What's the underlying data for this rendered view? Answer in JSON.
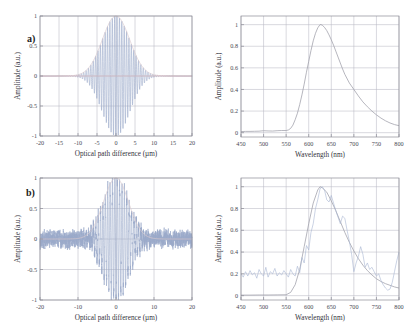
{
  "figure": {
    "background": "#ffffff",
    "width": 410,
    "height": 333
  },
  "panels": [
    {
      "id": "panel-a-interferogram",
      "label": "a)",
      "position": "top-left"
    },
    {
      "id": "panel-a-spectrum",
      "label": "",
      "position": "top-right"
    },
    {
      "id": "panel-b-interferogram",
      "label": "b)",
      "position": "bottom-left"
    },
    {
      "id": "panel-b-spectrum",
      "label": "",
      "position": "bottom-right"
    }
  ],
  "colors": {
    "signal": "#9aa9c9",
    "envelope": "#d9c9cd",
    "zero_line": "#e0b9bd",
    "spectrum_reference": "#9e9ea8",
    "spectrum_measured": "#a8b6d2",
    "grid": "#b9b9c4",
    "frame": "#8c8c96",
    "text": "#33333c"
  },
  "chart_data": [
    {
      "id": "panel-a-interferogram",
      "type": "line",
      "panel_label": "a)",
      "title": "",
      "xlabel": "Optical path difference (µm)",
      "ylabel": "Amplitude (a.u.)",
      "xlim": [
        -20,
        20
      ],
      "ylim": [
        -1,
        1
      ],
      "xticks": [
        -20,
        -15,
        -10,
        -5,
        0,
        5,
        10,
        15,
        20
      ],
      "xticklabels": [
        "-20",
        "-15",
        "-10",
        "-5",
        "0",
        "5",
        "10",
        "15",
        "20"
      ],
      "yticks": [
        -1,
        -0.5,
        0,
        0.5,
        1
      ],
      "yticklabels": [
        "-1",
        "-0.5",
        "0",
        "0.5",
        "1"
      ],
      "grid": true,
      "legend": "none",
      "series": [
        {
          "name": "Interferogram (simulated, noise-free)",
          "color": "#9aa9c9",
          "kind": "oscillation",
          "description": "Gaussian-enveloped cosine fringes centred at zero optical path difference",
          "carrier_period_um": 0.627,
          "envelope_sigma_um": 3.6,
          "peak_amplitude": 1.0,
          "phase_offset_um": -0.35
        },
        {
          "name": "Coherence envelope",
          "color": "#d9c9cd",
          "kind": "envelope",
          "description": "Gaussian envelope of the fringe packet, peak 1 at 0 µm",
          "envelope_sigma_um": 3.6,
          "peak_amplitude": 1.0
        },
        {
          "name": "Zero baseline",
          "color": "#e0b9bd",
          "kind": "baseline",
          "value": 0
        }
      ]
    },
    {
      "id": "panel-a-spectrum",
      "type": "line",
      "panel_label": "",
      "title": "",
      "xlabel": "Wavelength (nm)",
      "ylabel": "Amplitude (a.u.)",
      "xlim": [
        450,
        800
      ],
      "ylim": [
        -0.04,
        1.08
      ],
      "xticks": [
        450,
        500,
        550,
        600,
        650,
        700,
        750,
        800
      ],
      "xticklabels": [
        "450",
        "500",
        "550",
        "600",
        "650",
        "700",
        "750",
        "800"
      ],
      "yticks": [
        0,
        0.2,
        0.4,
        0.6,
        0.8,
        1
      ],
      "yticklabels": [
        "0",
        "0.2",
        "0.4",
        "0.6",
        "0.8",
        "1"
      ],
      "grid": true,
      "legend": "none",
      "series": [
        {
          "name": "Retrieved spectrum",
          "color": "#9e9ea8",
          "x": [
            450,
            460,
            470,
            480,
            490,
            500,
            510,
            520,
            530,
            540,
            550,
            555,
            560,
            565,
            570,
            575,
            580,
            585,
            590,
            595,
            600,
            605,
            610,
            615,
            620,
            625,
            627,
            630,
            635,
            640,
            645,
            650,
            655,
            660,
            665,
            670,
            675,
            680,
            690,
            700,
            710,
            720,
            730,
            740,
            750,
            760,
            770,
            780,
            790,
            800
          ],
          "y": [
            0.01,
            0.012,
            0.012,
            0.013,
            0.014,
            0.018,
            0.016,
            0.015,
            0.018,
            0.02,
            0.02,
            0.025,
            0.04,
            0.07,
            0.12,
            0.18,
            0.26,
            0.35,
            0.45,
            0.56,
            0.66,
            0.76,
            0.85,
            0.92,
            0.97,
            1.0,
            1.0,
            0.995,
            0.975,
            0.945,
            0.905,
            0.86,
            0.81,
            0.755,
            0.7,
            0.645,
            0.59,
            0.54,
            0.46,
            0.4,
            0.34,
            0.285,
            0.24,
            0.2,
            0.165,
            0.135,
            0.11,
            0.09,
            0.075,
            0.065
          ]
        }
      ]
    },
    {
      "id": "panel-b-interferogram",
      "type": "line",
      "panel_label": "b)",
      "title": "",
      "xlabel": "Optical path difference (µm)",
      "ylabel": "Amplitude (a.u.)",
      "xlim": [
        -20,
        20
      ],
      "ylim": [
        -1,
        1
      ],
      "xticks": [
        -20,
        -10,
        0,
        10,
        20
      ],
      "xticklabels": [
        "-20",
        "-10",
        "0",
        "10",
        "20"
      ],
      "yticks": [
        -1,
        -0.5,
        0,
        0.5,
        1
      ],
      "yticklabels": [
        "-1",
        "-0.5",
        "0",
        "0.5",
        "1"
      ],
      "grid": true,
      "legend": "none",
      "series": [
        {
          "name": "Measured interferogram (with noise)",
          "color": "#9aa9c9",
          "kind": "oscillation",
          "description": "Gaussian-enveloped fringes centred at zero path difference with broadband measurement noise over the full scan",
          "carrier_period_um": 0.627,
          "envelope_sigma_um": 3.3,
          "peak_amplitude": 1.0,
          "noise_amplitude": 0.14,
          "phase_offset_um": -0.3
        },
        {
          "name": "Coherence envelope",
          "color": "#d9c9cd",
          "kind": "envelope",
          "description": "Gaussian envelope of the fringe packet, peak 1 at 0 µm",
          "envelope_sigma_um": 3.3,
          "peak_amplitude": 1.0
        }
      ]
    },
    {
      "id": "panel-b-spectrum",
      "type": "line",
      "panel_label": "",
      "title": "",
      "xlabel": "Wavelength (nm)",
      "ylabel": "Amplitude (a.u.)",
      "xlim": [
        450,
        800
      ],
      "ylim": [
        -0.04,
        1.08
      ],
      "xticks": [
        450,
        500,
        550,
        600,
        650,
        700,
        750,
        800
      ],
      "xticklabels": [
        "450",
        "500",
        "550",
        "600",
        "650",
        "700",
        "750",
        "800"
      ],
      "yticks": [
        0,
        0.2,
        0.4,
        0.6,
        0.8,
        1
      ],
      "yticklabels": [
        "0",
        "0.2",
        "0.4",
        "0.6",
        "0.8",
        "1"
      ],
      "grid": true,
      "legend": "none",
      "series": [
        {
          "name": "Reference spectrum",
          "color": "#9e9ea8",
          "x": [
            450,
            470,
            490,
            510,
            530,
            550,
            560,
            570,
            580,
            590,
            600,
            610,
            620,
            625,
            630,
            640,
            650,
            660,
            670,
            680,
            690,
            700,
            710,
            720,
            730,
            740,
            750,
            760,
            770,
            780,
            790,
            800
          ],
          "y": [
            0.005,
            0.005,
            0.006,
            0.006,
            0.007,
            0.008,
            0.03,
            0.1,
            0.24,
            0.45,
            0.66,
            0.85,
            0.97,
            1.0,
            0.99,
            0.95,
            0.87,
            0.78,
            0.68,
            0.58,
            0.49,
            0.41,
            0.34,
            0.28,
            0.23,
            0.19,
            0.155,
            0.13,
            0.11,
            0.095,
            0.08,
            0.07
          ]
        },
        {
          "name": "Retrieved spectrum (noisy)",
          "color": "#a8b6d2",
          "x": [
            450,
            455,
            460,
            465,
            470,
            475,
            480,
            485,
            490,
            495,
            500,
            505,
            510,
            515,
            520,
            525,
            530,
            535,
            540,
            545,
            550,
            555,
            560,
            565,
            570,
            575,
            580,
            585,
            590,
            595,
            600,
            605,
            610,
            615,
            620,
            625,
            630,
            635,
            640,
            645,
            650,
            655,
            660,
            665,
            670,
            675,
            680,
            685,
            690,
            695,
            700,
            705,
            710,
            715,
            720,
            725,
            730,
            735,
            740,
            745,
            750,
            755,
            760,
            765,
            770,
            775,
            780,
            785,
            790,
            795,
            800
          ],
          "y": [
            0.2,
            0.17,
            0.22,
            0.18,
            0.23,
            0.19,
            0.21,
            0.16,
            0.24,
            0.2,
            0.18,
            0.26,
            0.17,
            0.22,
            0.2,
            0.25,
            0.18,
            0.21,
            0.19,
            0.23,
            0.2,
            0.17,
            0.24,
            0.2,
            0.18,
            0.27,
            0.21,
            0.35,
            0.3,
            0.46,
            0.42,
            0.58,
            0.66,
            0.8,
            0.88,
            0.98,
            1.0,
            0.97,
            0.88,
            0.86,
            0.92,
            0.85,
            0.78,
            0.72,
            0.66,
            0.73,
            0.71,
            0.6,
            0.5,
            0.38,
            0.22,
            0.3,
            0.36,
            0.45,
            0.38,
            0.26,
            0.3,
            0.24,
            0.26,
            0.22,
            0.18,
            0.2,
            0.14,
            0.1,
            0.07,
            0.05,
            0.06,
            0.12,
            0.22,
            0.32,
            0.4
          ]
        }
      ]
    }
  ]
}
